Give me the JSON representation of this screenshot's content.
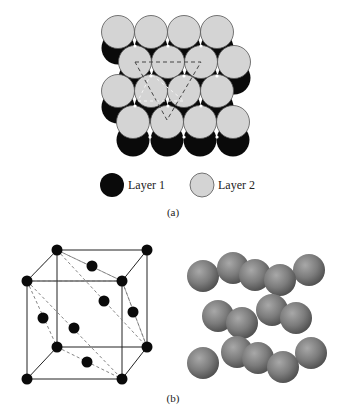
{
  "figure": {
    "panel_a": {
      "caption": "(a)",
      "legend": [
        {
          "label": "Layer 1",
          "color": "#0a0a0a"
        },
        {
          "label": "Layer 2",
          "color": "#d4d4d4"
        }
      ],
      "colors": {
        "layer1": "#0a0a0a",
        "layer2": "#d4d4d4",
        "outline": "#555555"
      }
    },
    "panel_b": {
      "caption": "(b)",
      "colors": {
        "atom": "#0a0a0a",
        "edge": "#222222",
        "dashed": "#666666",
        "sphere": "#7a7a7a"
      }
    }
  }
}
